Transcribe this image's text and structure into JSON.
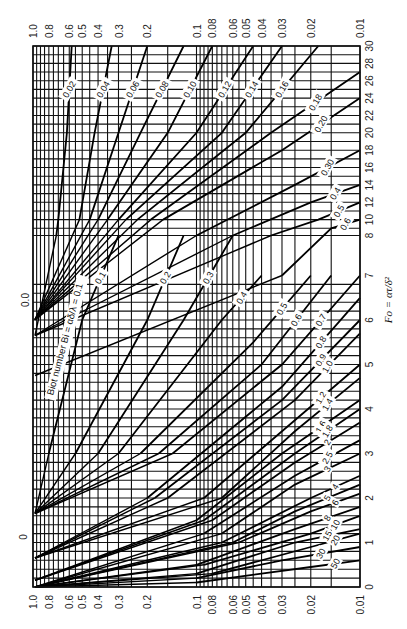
{
  "chart_data": {
    "type": "line",
    "orientation": "rotated-90-ccw",
    "xlabel": "Fo = ατ/δ²",
    "ylabel": "θ (mid-plane temperature ratio)",
    "y_scale": "log",
    "ylim": [
      0.01,
      1.0
    ],
    "y_ticks": [
      "1.0",
      "0.8",
      "0.6",
      "0.5",
      "0.4",
      "0.3",
      "0.2",
      "0.1",
      "0.08",
      "0.06",
      "0.05",
      "0.04",
      "0.03",
      "0.02",
      "0.01"
    ],
    "y_tick_values": [
      1.0,
      0.8,
      0.6,
      0.5,
      0.4,
      0.3,
      0.2,
      0.1,
      0.08,
      0.06,
      0.05,
      0.04,
      0.03,
      0.02,
      0.01
    ],
    "x_ticks": [
      "0",
      "1",
      "2",
      "3",
      "4",
      "5",
      "6",
      "7",
      "8",
      "10",
      "12",
      "14",
      "16",
      "18",
      "20",
      "22",
      "24",
      "26",
      "28",
      "30"
    ],
    "x_tick_values": [
      0,
      1,
      2,
      3,
      4,
      5,
      6,
      7,
      8,
      10,
      12,
      14,
      16,
      18,
      20,
      22,
      24,
      26,
      28,
      30
    ],
    "xlim": [
      0,
      30
    ],
    "x_axis_break": "scale changes between 7 and 8",
    "grid": true,
    "annotation": "Biot number Bi = αδ/λ",
    "extra_left_labels": [
      "0",
      "0.0"
    ],
    "series_parameter": "1/Bi = λ/(αδ)",
    "series_labels": [
      "0.02",
      "0.04",
      "0.06",
      "0.08",
      "0.10",
      "0.12",
      "0.14",
      "0.16",
      "0.18",
      "0.20",
      "0.30",
      "0.4",
      "0.5",
      "0.6",
      "0.1",
      "0.2",
      "0.3",
      "0.4",
      "0.5",
      "0.6",
      "0.7",
      "0.8",
      "0.9",
      "1.0",
      "1.2",
      "1.4",
      "1.6",
      "1.8",
      "2",
      "2.5",
      "3",
      "4",
      "5",
      "6",
      "8",
      "10",
      "15",
      "20",
      "30",
      "50"
    ],
    "series": [
      {
        "name": "Bi=0.02",
        "label": "0.02",
        "x": [
          30,
          20,
          10,
          8
        ],
        "y": [
          0.58,
          0.62,
          0.7,
          0.72
        ]
      },
      {
        "name": "Bi=0.04",
        "label": "0.04",
        "x": [
          30,
          20,
          10
        ],
        "y": [
          0.33,
          0.42,
          0.52
        ]
      },
      {
        "name": "Bi=0.06",
        "label": "0.06",
        "x": [
          30,
          20,
          10
        ],
        "y": [
          0.2,
          0.3,
          0.45
        ]
      },
      {
        "name": "Bi=0.08",
        "label": "0.08",
        "x": [
          30,
          20,
          10
        ],
        "y": [
          0.12,
          0.22,
          0.4
        ]
      },
      {
        "name": "Bi=0.10",
        "label": "0.10",
        "x": [
          30,
          20,
          10
        ],
        "y": [
          0.08,
          0.15,
          0.35
        ]
      },
      {
        "name": "Bi=0.12",
        "label": "0.12",
        "x": [
          30,
          20,
          10
        ],
        "y": [
          0.045,
          0.1,
          0.3
        ]
      },
      {
        "name": "Bi=0.14",
        "label": "0.14",
        "x": [
          30,
          20,
          10
        ],
        "y": [
          0.03,
          0.07,
          0.27
        ]
      },
      {
        "name": "Bi=0.16",
        "label": "0.16",
        "x": [
          30,
          20,
          10
        ],
        "y": [
          0.018,
          0.05,
          0.23
        ]
      },
      {
        "name": "Bi=0.18",
        "label": "0.18",
        "x": [
          27,
          20,
          10
        ],
        "y": [
          0.01,
          0.035,
          0.19
        ]
      },
      {
        "name": "Bi=0.20",
        "label": "0.20",
        "x": [
          24,
          18,
          10
        ],
        "y": [
          0.01,
          0.03,
          0.16
        ]
      },
      {
        "name": "Bi=0.30",
        "label": "0.30",
        "x": [
          18,
          14,
          8
        ],
        "y": [
          0.01,
          0.025,
          0.1
        ]
      },
      {
        "name": "Bi=0.4",
        "label": "0.4",
        "x": [
          14,
          12,
          8
        ],
        "y": [
          0.01,
          0.02,
          0.06
        ]
      },
      {
        "name": "Bi=0.5",
        "label": "0.5",
        "x": [
          12,
          10,
          8
        ],
        "y": [
          0.01,
          0.018,
          0.035
        ]
      },
      {
        "name": "Bi=0.6",
        "label": "0.6",
        "x": [
          10,
          9,
          7
        ],
        "y": [
          0.01,
          0.015,
          0.03
        ]
      },
      {
        "name": "1/Bi=0.1",
        "label": "0.1",
        "x": [
          8,
          6,
          3
        ],
        "y": [
          0.3,
          0.5,
          0.8
        ]
      },
      {
        "name": "1/Bi=0.2",
        "label": "0.2",
        "x": [
          8,
          6,
          3
        ],
        "y": [
          0.12,
          0.2,
          0.55
        ]
      },
      {
        "name": "1/Bi=0.3",
        "label": "0.3",
        "x": [
          8,
          6,
          3
        ],
        "y": [
          0.06,
          0.12,
          0.4
        ]
      },
      {
        "name": "1/Bi=0.4",
        "label": "0.4",
        "x": [
          7,
          6,
          3
        ],
        "y": [
          0.04,
          0.07,
          0.3
        ]
      },
      {
        "name": "1/Bi=0.5",
        "label": "0.5",
        "x": [
          7,
          5.5,
          3
        ],
        "y": [
          0.02,
          0.045,
          0.22
        ]
      },
      {
        "name": "1/Bi=0.6",
        "label": "0.6",
        "x": [
          7,
          5,
          3
        ],
        "y": [
          0.015,
          0.04,
          0.17
        ]
      },
      {
        "name": "1/Bi=0.7",
        "label": "0.7",
        "x": [
          7,
          5,
          3
        ],
        "y": [
          0.01,
          0.03,
          0.14
        ]
      },
      {
        "name": "1/Bi=0.8",
        "label": "0.8",
        "x": [
          6.5,
          4.5,
          2
        ],
        "y": [
          0.01,
          0.03,
          0.2
        ]
      },
      {
        "name": "1/Bi=0.9",
        "label": "0.9",
        "x": [
          6,
          4.2,
          2
        ],
        "y": [
          0.01,
          0.03,
          0.18
        ]
      },
      {
        "name": "1/Bi=1.0",
        "label": "1.0",
        "x": [
          5.7,
          4.2,
          2
        ],
        "y": [
          0.01,
          0.025,
          0.15
        ]
      },
      {
        "name": "1/Bi=1.2",
        "label": "1.2",
        "x": [
          5,
          3.5,
          2
        ],
        "y": [
          0.01,
          0.03,
          0.09
        ]
      },
      {
        "name": "1/Bi=1.4",
        "label": "1.4",
        "x": [
          4.7,
          3.5,
          2
        ],
        "y": [
          0.01,
          0.025,
          0.07
        ]
      },
      {
        "name": "1/Bi=1.6",
        "label": "1.6",
        "x": [
          4.2,
          3,
          1.5
        ],
        "y": [
          0.01,
          0.03,
          0.1
        ]
      },
      {
        "name": "1/Bi=1.8",
        "label": "1.8",
        "x": [
          4,
          3,
          1.5
        ],
        "y": [
          0.01,
          0.025,
          0.09
        ]
      },
      {
        "name": "1/Bi=2",
        "label": "2",
        "x": [
          3.7,
          2.8,
          1.5
        ],
        "y": [
          0.01,
          0.025,
          0.08
        ]
      },
      {
        "name": "1/Bi=2.5",
        "label": "2.5",
        "x": [
          3.3,
          2.5,
          1.2
        ],
        "y": [
          0.01,
          0.025,
          0.09
        ]
      },
      {
        "name": "1/Bi=3",
        "label": "3",
        "x": [
          3,
          2.3,
          1.2
        ],
        "y": [
          0.01,
          0.025,
          0.07
        ]
      },
      {
        "name": "1/Bi=4",
        "label": "4",
        "x": [
          2.5,
          2,
          1
        ],
        "y": [
          0.01,
          0.02,
          0.07
        ]
      },
      {
        "name": "1/Bi=5",
        "label": "5",
        "x": [
          2.3,
          1.7,
          1
        ],
        "y": [
          0.01,
          0.025,
          0.06
        ]
      },
      {
        "name": "1/Bi=6",
        "label": "6",
        "x": [
          2.1,
          1.7,
          1
        ],
        "y": [
          0.01,
          0.02,
          0.055
        ]
      },
      {
        "name": "1/Bi=8",
        "label": "8",
        "x": [
          1.8,
          1.3,
          0.5
        ],
        "y": [
          0.01,
          0.025,
          0.1
        ]
      },
      {
        "name": "1/Bi=10",
        "label": "10",
        "x": [
          1.6,
          1.2,
          0.5
        ],
        "y": [
          0.01,
          0.02,
          0.09
        ]
      },
      {
        "name": "1/Bi=15",
        "label": "15",
        "x": [
          1.3,
          1,
          0.3
        ],
        "y": [
          0.01,
          0.025,
          0.1
        ]
      },
      {
        "name": "1/Bi=20",
        "label": "20",
        "x": [
          1.2,
          0.9,
          0.3
        ],
        "y": [
          0.01,
          0.02,
          0.08
        ]
      },
      {
        "name": "1/Bi=30",
        "label": "30",
        "x": [
          0.9,
          0.6,
          0.2
        ],
        "y": [
          0.01,
          0.03,
          0.1
        ]
      },
      {
        "name": "1/Bi=50",
        "label": "50",
        "x": [
          0.6,
          0.45,
          0.1
        ],
        "y": [
          0.01,
          0.02,
          0.1
        ]
      }
    ]
  },
  "annotations": {
    "biot_label": "Biot number Bi = αδ/λ = 0.1",
    "fo_label": "Fo = ατ/δ²",
    "zero_top": "0.0",
    "zero_bottom": "0"
  }
}
